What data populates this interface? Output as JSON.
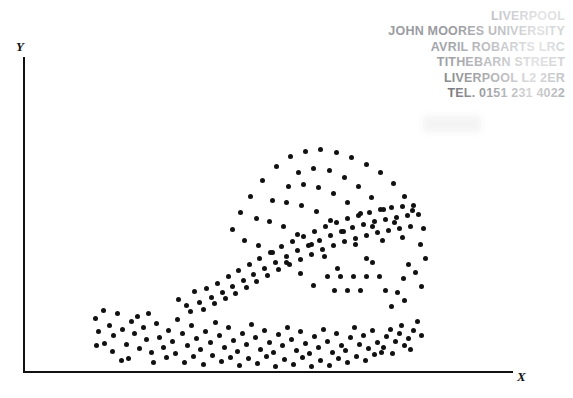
{
  "figure": {
    "type": "scatter-plot",
    "background_color": "#ffffff",
    "ink_color": "#111111"
  },
  "axes": {
    "x_label": "X",
    "y_label": "Y",
    "x_axis_name": "x-axis",
    "y_axis_name": "y-axis",
    "ticks": false,
    "tick_labels": [],
    "gridlines": false
  },
  "library_stamp": {
    "color": "#8e9095",
    "lines": [
      "LIVERPOOL",
      "JOHN MOORES UNIVERSITY",
      "AVRIL ROBARTS LRC",
      "TITHEBARN STREET",
      "LIVERPOOL L2 2ER",
      "TEL. 0151 231 4022"
    ]
  },
  "chart_data": {
    "type": "scatter",
    "title": "",
    "xlabel": "X",
    "ylabel": "Y",
    "xlim": [
      0,
      100
    ],
    "ylim": [
      0,
      100
    ],
    "grid": false,
    "legend": null,
    "marker": {
      "shape": "circle",
      "color": "#111111",
      "size_px": 5
    },
    "n_points": 192,
    "points": [
      [
        95,
        318
      ],
      [
        103,
        310
      ],
      [
        109,
        325
      ],
      [
        98,
        331
      ],
      [
        113,
        335
      ],
      [
        104,
        343
      ],
      [
        96,
        345
      ],
      [
        117,
        313
      ],
      [
        122,
        329
      ],
      [
        112,
        351
      ],
      [
        126,
        344
      ],
      [
        131,
        321
      ],
      [
        134,
        333
      ],
      [
        128,
        358
      ],
      [
        121,
        360
      ],
      [
        139,
        348
      ],
      [
        143,
        327
      ],
      [
        137,
        316
      ],
      [
        146,
        339
      ],
      [
        151,
        352
      ],
      [
        148,
        313
      ],
      [
        156,
        323
      ],
      [
        159,
        337
      ],
      [
        153,
        362
      ],
      [
        163,
        347
      ],
      [
        168,
        330
      ],
      [
        166,
        357
      ],
      [
        172,
        341
      ],
      [
        177,
        319
      ],
      [
        175,
        353
      ],
      [
        182,
        333
      ],
      [
        187,
        345
      ],
      [
        184,
        362
      ],
      [
        191,
        325
      ],
      [
        196,
        338
      ],
      [
        193,
        356
      ],
      [
        200,
        349
      ],
      [
        205,
        331
      ],
      [
        203,
        364
      ],
      [
        210,
        342
      ],
      [
        215,
        322
      ],
      [
        212,
        355
      ],
      [
        219,
        335
      ],
      [
        224,
        347
      ],
      [
        221,
        361
      ],
      [
        228,
        327
      ],
      [
        233,
        340
      ],
      [
        230,
        357
      ],
      [
        237,
        351
      ],
      [
        242,
        333
      ],
      [
        239,
        365
      ],
      [
        246,
        344
      ],
      [
        251,
        324
      ],
      [
        248,
        358
      ],
      [
        255,
        337
      ],
      [
        260,
        349
      ],
      [
        257,
        363
      ],
      [
        264,
        330
      ],
      [
        269,
        342
      ],
      [
        266,
        356
      ],
      [
        273,
        352
      ],
      [
        278,
        334
      ],
      [
        275,
        366
      ],
      [
        282,
        345
      ],
      [
        287,
        327
      ],
      [
        284,
        359
      ],
      [
        291,
        339
      ],
      [
        296,
        350
      ],
      [
        293,
        364
      ],
      [
        300,
        331
      ],
      [
        305,
        343
      ],
      [
        302,
        357
      ],
      [
        309,
        353
      ],
      [
        314,
        336
      ],
      [
        311,
        366
      ],
      [
        318,
        347
      ],
      [
        323,
        329
      ],
      [
        320,
        360
      ],
      [
        327,
        341
      ],
      [
        332,
        352
      ],
      [
        329,
        365
      ],
      [
        336,
        333
      ],
      [
        341,
        345
      ],
      [
        338,
        358
      ],
      [
        345,
        350
      ],
      [
        350,
        337
      ],
      [
        347,
        362
      ],
      [
        354,
        327
      ],
      [
        359,
        344
      ],
      [
        356,
        356
      ],
      [
        363,
        335
      ],
      [
        368,
        348
      ],
      [
        365,
        360
      ],
      [
        372,
        330
      ],
      [
        377,
        342
      ],
      [
        374,
        354
      ],
      [
        381,
        352
      ],
      [
        386,
        336
      ],
      [
        383,
        347
      ],
      [
        390,
        329
      ],
      [
        395,
        341
      ],
      [
        392,
        353
      ],
      [
        399,
        333
      ],
      [
        404,
        345
      ],
      [
        401,
        325
      ],
      [
        408,
        338
      ],
      [
        413,
        330
      ],
      [
        410,
        349
      ],
      [
        417,
        321
      ],
      [
        421,
        335
      ],
      [
        178,
        299
      ],
      [
        186,
        305
      ],
      [
        194,
        291
      ],
      [
        190,
        311
      ],
      [
        199,
        302
      ],
      [
        206,
        288
      ],
      [
        203,
        309
      ],
      [
        211,
        297
      ],
      [
        217,
        283
      ],
      [
        214,
        303
      ],
      [
        222,
        292
      ],
      [
        228,
        276
      ],
      [
        225,
        298
      ],
      [
        232,
        286
      ],
      [
        238,
        270
      ],
      [
        235,
        293
      ],
      [
        243,
        280
      ],
      [
        249,
        264
      ],
      [
        246,
        287
      ],
      [
        253,
        274
      ],
      [
        259,
        258
      ],
      [
        256,
        281
      ],
      [
        264,
        268
      ],
      [
        270,
        252
      ],
      [
        267,
        275
      ],
      [
        275,
        262
      ],
      [
        281,
        246
      ],
      [
        278,
        269
      ],
      [
        286,
        256
      ],
      [
        292,
        241
      ],
      [
        289,
        264
      ],
      [
        297,
        250
      ],
      [
        303,
        236
      ],
      [
        300,
        259
      ],
      [
        308,
        245
      ],
      [
        314,
        231
      ],
      [
        311,
        254
      ],
      [
        319,
        240
      ],
      [
        325,
        226
      ],
      [
        322,
        249
      ],
      [
        330,
        235
      ],
      [
        336,
        222
      ],
      [
        333,
        245
      ],
      [
        341,
        231
      ],
      [
        347,
        218
      ],
      [
        344,
        241
      ],
      [
        352,
        227
      ],
      [
        358,
        215
      ],
      [
        355,
        238
      ],
      [
        363,
        224
      ],
      [
        369,
        212
      ],
      [
        366,
        235
      ],
      [
        374,
        221
      ],
      [
        380,
        209
      ],
      [
        377,
        232
      ],
      [
        385,
        219
      ],
      [
        391,
        207
      ],
      [
        388,
        230
      ],
      [
        396,
        217
      ],
      [
        402,
        206
      ],
      [
        399,
        228
      ],
      [
        407,
        215
      ],
      [
        413,
        205
      ],
      [
        410,
        226
      ],
      [
        418,
        214
      ],
      [
        423,
        228
      ],
      [
        420,
        244
      ],
      [
        425,
        258
      ],
      [
        415,
        272
      ],
      [
        421,
        286
      ],
      [
        408,
        264
      ],
      [
        403,
        278
      ],
      [
        397,
        292
      ],
      [
        404,
        300
      ],
      [
        391,
        306
      ],
      [
        385,
        290
      ],
      [
        379,
        276
      ],
      [
        372,
        262
      ],
      [
        366,
        276
      ],
      [
        360,
        290
      ],
      [
        353,
        276
      ],
      [
        347,
        290
      ],
      [
        340,
        276
      ],
      [
        334,
        290
      ],
      [
        327,
        276
      ],
      [
        290,
        156
      ],
      [
        305,
        151
      ],
      [
        320,
        149
      ],
      [
        336,
        152
      ],
      [
        351,
        157
      ],
      [
        366,
        164
      ],
      [
        380,
        172
      ],
      [
        393,
        183
      ],
      [
        404,
        196
      ],
      [
        412,
        210
      ],
      [
        276,
        166
      ],
      [
        262,
        180
      ],
      [
        250,
        196
      ],
      [
        240,
        212
      ],
      [
        232,
        229
      ],
      [
        298,
        172
      ],
      [
        313,
        168
      ],
      [
        329,
        170
      ],
      [
        344,
        177
      ],
      [
        358,
        186
      ],
      [
        371,
        197
      ],
      [
        383,
        209
      ],
      [
        394,
        222
      ],
      [
        402,
        237
      ],
      [
        288,
        186
      ],
      [
        303,
        184
      ],
      [
        318,
        187
      ],
      [
        333,
        193
      ],
      [
        347,
        202
      ],
      [
        360,
        213
      ],
      [
        372,
        226
      ],
      [
        382,
        240
      ],
      [
        272,
        200
      ],
      [
        286,
        202
      ],
      [
        301,
        205
      ],
      [
        316,
        211
      ],
      [
        330,
        220
      ],
      [
        343,
        231
      ],
      [
        355,
        244
      ],
      [
        366,
        258
      ],
      [
        256,
        218
      ],
      [
        269,
        221
      ],
      [
        283,
        226
      ],
      [
        297,
        234
      ],
      [
        311,
        244
      ],
      [
        324,
        256
      ],
      [
        337,
        268
      ],
      [
        244,
        240
      ],
      [
        258,
        245
      ],
      [
        272,
        252
      ],
      [
        286,
        262
      ],
      [
        300,
        273
      ],
      [
        313,
        285
      ]
    ]
  }
}
